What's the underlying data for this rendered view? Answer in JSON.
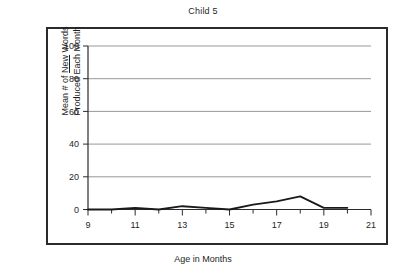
{
  "chart_data": {
    "type": "line",
    "title": "Child 5",
    "xlabel": "Age in Months",
    "ylabel_line1_pre": "Mean # of ",
    "ylabel_line1_underlined": "New",
    "ylabel_line1_post": " Words",
    "ylabel_line2": "Produced Each Month",
    "ylabel_plain": "Mean # of New Words Produced Each Month",
    "x": [
      9,
      10,
      11,
      12,
      13,
      14,
      15,
      16,
      17,
      18,
      19,
      20
    ],
    "values": [
      0,
      0,
      1,
      0,
      2,
      1,
      0,
      3,
      5,
      8,
      1,
      1
    ],
    "xlim": [
      9,
      21
    ],
    "ylim": [
      0,
      100
    ],
    "xticks": [
      9,
      11,
      13,
      15,
      17,
      19,
      21
    ],
    "xtick_labels": [
      "9",
      "11",
      "13",
      "15",
      "17",
      "19",
      "21"
    ],
    "xminor_ticks": [
      10,
      12,
      14,
      16,
      18,
      20
    ],
    "yticks": [
      0,
      20,
      40,
      60,
      80,
      100
    ],
    "ytick_labels": [
      "0",
      "20",
      "40",
      "60",
      "80",
      "100"
    ],
    "grid": "horizontal",
    "legend": "none",
    "series_color": "#1a1a1a",
    "grid_color": "#8c8c8c",
    "axis_color": "#2b2b2b",
    "background": "#ffffff"
  }
}
